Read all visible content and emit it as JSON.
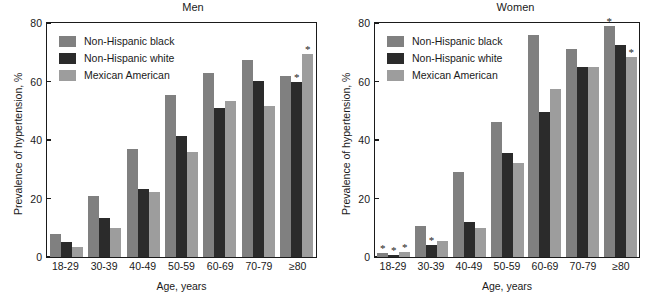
{
  "figure": {
    "xlabel": "Age, years",
    "ylabel": "Prevalence of hypertension, %"
  },
  "chart_data": [
    {
      "type": "bar",
      "title": "Men",
      "xlabel": "Age, years",
      "ylabel": "Prevalence of hypertension, %",
      "ylim": [
        0,
        80
      ],
      "yticks": [
        0,
        20,
        40,
        60,
        80
      ],
      "grid": false,
      "legend_position": "top-left",
      "categories": [
        "18-29",
        "30-39",
        "40-49",
        "50-59",
        "60-69",
        "70-79",
        "≥80"
      ],
      "series": [
        {
          "name": "Non-Hispanic black",
          "color": "#808080",
          "values": [
            8.0,
            21.0,
            37.0,
            55.5,
            63.0,
            67.5,
            62.0
          ],
          "annotations": [
            "",
            "",
            "",
            "",
            "",
            "",
            ""
          ]
        },
        {
          "name": "Non-Hispanic white",
          "color": "#2b2b2b",
          "values": [
            5.3,
            13.5,
            23.3,
            41.3,
            51.0,
            60.2,
            60.0
          ],
          "annotations": [
            "",
            "",
            "",
            "",
            "",
            "",
            "*"
          ]
        },
        {
          "name": "Mexican American",
          "color": "#9d9d9d",
          "values": [
            3.5,
            10.0,
            22.3,
            36.0,
            53.5,
            51.5,
            69.5
          ],
          "annotations": [
            "",
            "",
            "",
            "",
            "",
            "",
            "*"
          ]
        }
      ]
    },
    {
      "type": "bar",
      "title": "Women",
      "xlabel": "Age, years",
      "ylabel": "Prevalence of hypertension, %",
      "ylim": [
        0,
        80
      ],
      "yticks": [
        0,
        20,
        40,
        60,
        80
      ],
      "grid": false,
      "legend_position": "top-left",
      "categories": [
        "18-29",
        "30-39",
        "40-49",
        "50-59",
        "60-69",
        "70-79",
        "≥80"
      ],
      "series": [
        {
          "name": "Non-Hispanic black",
          "color": "#808080",
          "values": [
            1.5,
            10.5,
            29.0,
            46.3,
            76.0,
            71.0,
            79.0
          ],
          "annotations": [
            "*",
            "",
            "",
            "",
            "",
            "",
            "*"
          ]
        },
        {
          "name": "Non-Hispanic white",
          "color": "#2b2b2b",
          "values": [
            0.8,
            4.0,
            12.0,
            35.5,
            49.5,
            65.0,
            72.5
          ],
          "annotations": [
            "*",
            "*",
            "",
            "",
            "",
            "",
            ""
          ]
        },
        {
          "name": "Mexican American",
          "color": "#9d9d9d",
          "values": [
            1.8,
            5.5,
            10.0,
            32.0,
            57.5,
            65.0,
            68.5
          ],
          "annotations": [
            "*",
            "",
            "",
            "",
            "",
            "",
            "*"
          ]
        }
      ]
    }
  ]
}
